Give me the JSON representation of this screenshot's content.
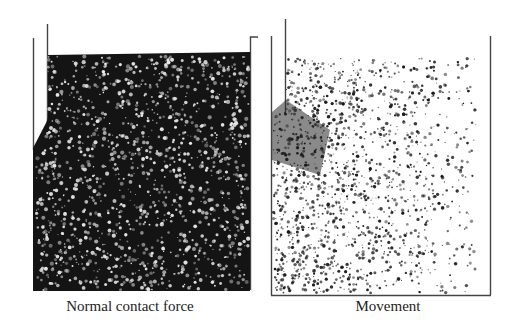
{
  "figure": {
    "panels": [
      {
        "id": "left",
        "caption": "Normal contact force",
        "style": "dark",
        "background": "#151515",
        "particle_color": "#e8e8e8"
      },
      {
        "id": "right",
        "caption": "Movement",
        "style": "light",
        "background": "#ffffff",
        "particle_color": "#1a1a1a"
      }
    ]
  }
}
